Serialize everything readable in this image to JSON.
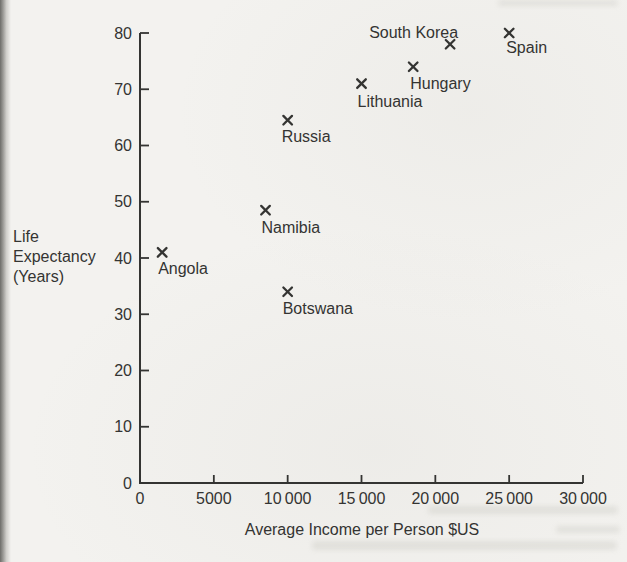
{
  "figure": {
    "background_color": "#f3f2ef",
    "ink_color": "#343432"
  },
  "chart_data": {
    "type": "scatter",
    "title": "",
    "xlabel": "Average Income per Person $US",
    "ylabel_lines": [
      "Life",
      "Expectancy",
      "(Years)"
    ],
    "xlim": [
      0,
      30000
    ],
    "ylim": [
      0,
      80
    ],
    "x_ticks": [
      0,
      5000,
      10000,
      15000,
      20000,
      25000,
      30000
    ],
    "x_tick_labels": [
      "0",
      "5000",
      "10 000",
      "15 000",
      "20 000",
      "25 000",
      "30 000"
    ],
    "y_ticks": [
      0,
      10,
      20,
      30,
      40,
      50,
      60,
      70,
      80
    ],
    "y_tick_labels": [
      "0",
      "10",
      "20",
      "30",
      "40",
      "50",
      "60",
      "70",
      "80"
    ],
    "grid": false,
    "legend": "none",
    "marker": "x",
    "points": [
      {
        "label": "Angola",
        "x": 1500,
        "y": 41,
        "label_anchor": "start",
        "label_dx": -4,
        "label_dy": 22
      },
      {
        "label": "Namibia",
        "x": 8500,
        "y": 48.5,
        "label_anchor": "start",
        "label_dx": -4,
        "label_dy": 23
      },
      {
        "label": "Botswana",
        "x": 10000,
        "y": 34,
        "label_anchor": "start",
        "label_dx": -5,
        "label_dy": 22
      },
      {
        "label": "Russia",
        "x": 10000,
        "y": 64.5,
        "label_anchor": "start",
        "label_dx": -6,
        "label_dy": 22
      },
      {
        "label": "Lithuania",
        "x": 15000,
        "y": 71,
        "label_anchor": "start",
        "label_dx": -4,
        "label_dy": 23
      },
      {
        "label": "Hungary",
        "x": 18500,
        "y": 74,
        "label_anchor": "start",
        "label_dx": -3,
        "label_dy": 22
      },
      {
        "label": "South Korea",
        "x": 21000,
        "y": 78,
        "label_anchor": "end",
        "label_dx": 8,
        "label_dy": -6
      },
      {
        "label": "Spain",
        "x": 25000,
        "y": 80,
        "label_anchor": "start",
        "label_dx": -3,
        "label_dy": 20
      }
    ]
  }
}
